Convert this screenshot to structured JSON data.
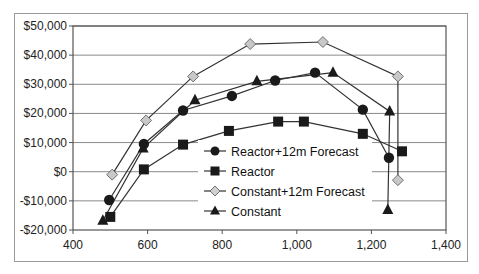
{
  "chart_data": {
    "type": "scatter",
    "title": "",
    "xlabel": "",
    "ylabel": "",
    "xlim": [
      400,
      1400
    ],
    "ylim": [
      -20000,
      50000
    ],
    "grid": {
      "horizontal": true,
      "vertical": false
    },
    "legend_position": "inside-center-bottom",
    "x_ticks": [
      400,
      600,
      800,
      1000,
      1200,
      1400
    ],
    "x_tick_labels": [
      "400",
      "600",
      "800",
      "1,000",
      "1,200",
      "1,400"
    ],
    "y_ticks": [
      50000,
      40000,
      30000,
      20000,
      10000,
      0,
      -10000,
      -20000
    ],
    "y_tick_labels": [
      "$50,000",
      "$40,000",
      "$30,000",
      "$20,000",
      "$10,000",
      "$0",
      "-$10,000",
      "-$20,000"
    ],
    "series": [
      {
        "name": "Reactor+12m Forecast",
        "marker": "circle",
        "marker_fill": "#1a1a1a",
        "line_color": "#333333",
        "points": [
          [
            497,
            -9700
          ],
          [
            590,
            9500
          ],
          [
            695,
            21000
          ],
          [
            826,
            26000
          ],
          [
            942,
            31300
          ],
          [
            1049,
            34000
          ],
          [
            1177,
            21300
          ],
          [
            1247,
            4800
          ]
        ]
      },
      {
        "name": "Reactor",
        "marker": "square",
        "marker_fill": "#1a1a1a",
        "line_color": "#333333",
        "points": [
          [
            500,
            -15500
          ],
          [
            590,
            800
          ],
          [
            695,
            9300
          ],
          [
            818,
            14000
          ],
          [
            950,
            17200
          ],
          [
            1019,
            17200
          ],
          [
            1177,
            13000
          ],
          [
            1282,
            7000
          ]
        ]
      },
      {
        "name": "Constant+12m Forecast",
        "marker": "diamond",
        "marker_fill": "#c8c8c8",
        "line_color": "#333333",
        "points": [
          [
            505,
            -1000
          ],
          [
            596,
            17600
          ],
          [
            722,
            32700
          ],
          [
            875,
            43800
          ],
          [
            1070,
            44500
          ],
          [
            1271,
            32700
          ],
          [
            1271,
            -2900
          ]
        ]
      },
      {
        "name": "Constant",
        "marker": "triangle",
        "marker_fill": "#1a1a1a",
        "line_color": "#333333",
        "points": [
          [
            480,
            -16800
          ],
          [
            588,
            8000
          ],
          [
            727,
            24500
          ],
          [
            893,
            31000
          ],
          [
            1097,
            34000
          ],
          [
            1249,
            20700
          ],
          [
            1244,
            -13100
          ]
        ]
      }
    ]
  },
  "legend": {
    "items": [
      {
        "label": "Reactor+12m Forecast"
      },
      {
        "label": "Reactor"
      },
      {
        "label": "Constant+12m Forecast"
      },
      {
        "label": "Constant"
      }
    ]
  }
}
